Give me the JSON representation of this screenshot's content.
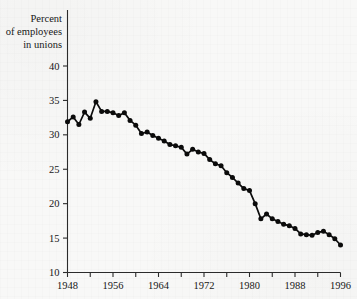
{
  "chart_data": {
    "type": "line",
    "title": "",
    "subtitle": "",
    "ylabel_lines": [
      "Percent",
      "of employees",
      "in unions"
    ],
    "xlabel": "",
    "xlim": [
      1948,
      1996
    ],
    "ylim": [
      10,
      40
    ],
    "grid": false,
    "legend": null,
    "markers": "filled-circle",
    "x_tick_labels": [
      "1948",
      "1956",
      "1964",
      "1972",
      "1980",
      "1988",
      "1996"
    ],
    "x_tick_label_values": [
      1948,
      1956,
      1964,
      1972,
      1980,
      1988,
      1996
    ],
    "x_minor_ticks": [
      1948,
      1952,
      1956,
      1960,
      1964,
      1968,
      1972,
      1976,
      1980,
      1984,
      1988,
      1992,
      1996
    ],
    "y_tick_labels": [
      "10",
      "15",
      "20",
      "25",
      "30",
      "35",
      "40"
    ],
    "y_tick_values": [
      10,
      15,
      20,
      25,
      30,
      35,
      40
    ],
    "x": [
      1948,
      1949,
      1950,
      1951,
      1952,
      1953,
      1954,
      1955,
      1956,
      1957,
      1958,
      1959,
      1960,
      1961,
      1962,
      1963,
      1964,
      1965,
      1966,
      1967,
      1968,
      1969,
      1970,
      1971,
      1972,
      1973,
      1974,
      1975,
      1976,
      1977,
      1978,
      1979,
      1980,
      1981,
      1982,
      1983,
      1984,
      1985,
      1986,
      1987,
      1988,
      1989,
      1990,
      1991,
      1992,
      1993,
      1994,
      1995,
      1996
    ],
    "values": [
      31.9,
      32.6,
      31.5,
      33.3,
      32.4,
      34.8,
      33.4,
      33.4,
      33.2,
      32.8,
      33.2,
      32.1,
      31.4,
      30.2,
      30.4,
      29.9,
      29.5,
      29.1,
      28.6,
      28.4,
      28.2,
      27.2,
      27.9,
      27.5,
      27.3,
      26.4,
      25.8,
      25.5,
      24.5,
      23.8,
      23.0,
      22.2,
      21.9,
      20.0,
      17.8,
      18.5,
      17.8,
      17.4,
      17.0,
      16.8,
      16.4,
      15.6,
      15.5,
      15.4,
      15.8,
      16.0,
      15.5,
      14.9,
      14.0
    ],
    "series": [
      {
        "name": "Percent of employees in unions",
        "color": "#0b0b0b",
        "values": [
          31.9,
          32.6,
          31.5,
          33.3,
          32.4,
          34.8,
          33.4,
          33.4,
          33.2,
          32.8,
          33.2,
          32.1,
          31.4,
          30.2,
          30.4,
          29.9,
          29.5,
          29.1,
          28.6,
          28.4,
          28.2,
          27.2,
          27.9,
          27.5,
          27.3,
          26.4,
          25.8,
          25.5,
          24.5,
          23.8,
          23.0,
          22.2,
          21.9,
          20.0,
          17.8,
          18.5,
          17.8,
          17.4,
          17.0,
          16.8,
          16.4,
          15.6,
          15.5,
          15.4,
          15.8,
          16.0,
          15.5,
          14.9,
          14.0
        ]
      }
    ],
    "annotations": []
  },
  "colors": {
    "background": "#f7f7f6",
    "axis": "#2b2b2b",
    "ink": "#0b0b0b",
    "text": "#171717"
  }
}
